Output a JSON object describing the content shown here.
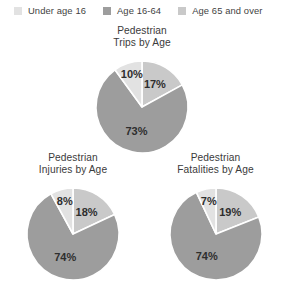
{
  "legend": {
    "position": "top",
    "items": [
      {
        "label": "Under age 16",
        "color": "#e2e2e2",
        "key": "under16"
      },
      {
        "label": "Age 16-64",
        "color": "#9d9d9d",
        "key": "age16to64"
      },
      {
        "label": "Age 65 and over",
        "color": "#c9c9c9",
        "key": "age65plus"
      }
    ]
  },
  "chart_data": [
    {
      "type": "pie",
      "id": "trips",
      "title": "Pedestrian\nTrips by Age",
      "categories": [
        "Under age 16",
        "Age 16-64",
        "Age 65 and over"
      ],
      "values": [
        10,
        73,
        17
      ],
      "labels": [
        "10%",
        "73%",
        "17%"
      ],
      "colors": [
        "#e2e2e2",
        "#9d9d9d",
        "#c9c9c9"
      ],
      "units": "percent",
      "start_angle_deg": 0,
      "direction": "clockwise",
      "grid": false,
      "legend_position": "top"
    },
    {
      "type": "pie",
      "id": "injuries",
      "title": "Pedestrian\nInjuries by Age",
      "categories": [
        "Under age 16",
        "Age 16-64",
        "Age 65 and over"
      ],
      "values": [
        8,
        74,
        18
      ],
      "labels": [
        "8%",
        "74%",
        "18%"
      ],
      "colors": [
        "#e2e2e2",
        "#9d9d9d",
        "#c9c9c9"
      ],
      "units": "percent",
      "start_angle_deg": 0,
      "direction": "clockwise",
      "grid": false,
      "legend_position": "top"
    },
    {
      "type": "pie",
      "id": "fatalities",
      "title": "Pedestrian\nFatalities by Age",
      "categories": [
        "Under age 16",
        "Age 16-64",
        "Age 65 and over"
      ],
      "values": [
        7,
        74,
        19
      ],
      "labels": [
        "7%",
        "74%",
        "19%"
      ],
      "colors": [
        "#e2e2e2",
        "#9d9d9d",
        "#c9c9c9"
      ],
      "units": "percent",
      "start_angle_deg": 0,
      "direction": "clockwise",
      "grid": false,
      "legend_position": "top"
    }
  ]
}
